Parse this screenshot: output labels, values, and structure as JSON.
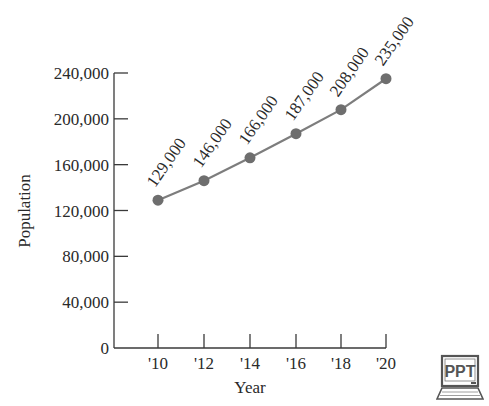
{
  "chart_data": {
    "type": "line",
    "title": "",
    "xlabel": "Year",
    "ylabel": "Population",
    "categories": [
      "'10",
      "'12",
      "'14",
      "'16",
      "'18",
      "'20"
    ],
    "series": [
      {
        "name": "Population",
        "values": [
          129000,
          146000,
          166000,
          187000,
          208000,
          235000
        ],
        "data_labels": [
          "129,000",
          "146,000",
          "166,000",
          "187,000",
          "208,000",
          "235,000"
        ]
      }
    ],
    "y_ticks": [
      0,
      40000,
      80000,
      120000,
      160000,
      200000,
      240000
    ],
    "y_tick_labels": [
      "0",
      "40,000",
      "80,000",
      "120,000",
      "160,000",
      "200,000",
      "240,000"
    ],
    "ylim": [
      0,
      240000
    ],
    "grid": false,
    "legend": "none",
    "colors": {
      "line": "#7d7d7d",
      "marker": "#6e6e6e",
      "axis": "#3a3a3a",
      "text": "#2a2a2a"
    }
  },
  "badge": {
    "label": "PPT"
  }
}
